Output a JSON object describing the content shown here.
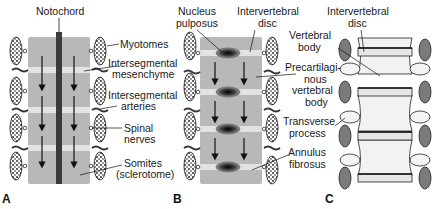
{
  "figure": {
    "panels": [
      {
        "letter": "A",
        "labels": {
          "notochord": "Notochord",
          "myotomes": "Myotomes",
          "intersegmental_mesenchyme_1": "Intersegmental",
          "intersegmental_mesenchyme_2": "mesenchyme",
          "intersegmental_arteries_1": "Intersegmental",
          "intersegmental_arteries_2": "arteries",
          "spinal_nerves_1": "Spinal",
          "spinal_nerves_2": "nerves",
          "somites_1": "Somites",
          "somites_2": "(sclerotome)"
        }
      },
      {
        "letter": "B",
        "labels": {
          "nucleus_pulposus_1": "Nucleus",
          "nucleus_pulposus_2": "pulposus",
          "intervertebral_disc_1": "Intervertebral",
          "intervertebral_disc_2": "disc",
          "precartilaginous_1": "Precartilagi-",
          "precartilaginous_2": "nous",
          "precartilaginous_3": "vertebral",
          "precartilaginous_4": "body",
          "annulus_fibrosus_1": "Annulus",
          "annulus_fibrosus_2": "fibrosus"
        }
      },
      {
        "letter": "C",
        "labels": {
          "intervertebral_disc_1": "Intervertebral",
          "intervertebral_disc_2": "disc",
          "vertebral_body_1": "Vertebral",
          "vertebral_body_2": "body",
          "transverse_process_1": "Transverse",
          "transverse_process_2": "process"
        }
      }
    ],
    "colors": {
      "sclerotome": "#b8b8b8",
      "mesenchyme_band": "#e2e2e2",
      "notochord": "#3a3a3a",
      "myotome": "#2a2a2a",
      "vertebra_bone": "#f2f2f2",
      "vertebra_outline": "#222222",
      "ganglion": "#7a7a7a"
    }
  }
}
